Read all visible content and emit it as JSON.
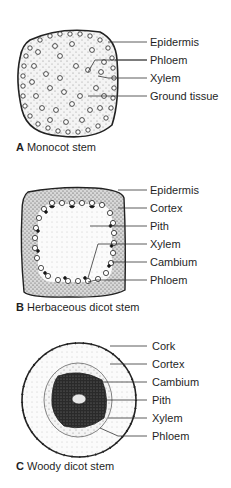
{
  "panels": [
    {
      "id": "A",
      "letter": "A",
      "caption": "Monocot stem",
      "labels": [
        "Epidermis",
        "Phloem",
        "Xylem",
        "Ground tissue"
      ]
    },
    {
      "id": "B",
      "letter": "B",
      "caption": "Herbaceous dicot stem",
      "labels": [
        "Epidermis",
        "Cortex",
        "Pith",
        "Xylem",
        "Cambium",
        "Phloem"
      ]
    },
    {
      "id": "C",
      "letter": "C",
      "caption": "Woody dicot stem",
      "labels": [
        "Cork",
        "Cortex",
        "Cambium",
        "Pith",
        "Xylem",
        "Phloem"
      ]
    }
  ]
}
